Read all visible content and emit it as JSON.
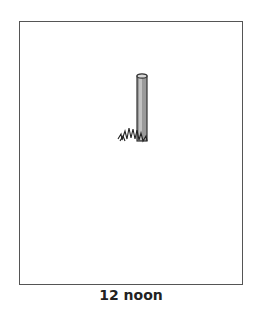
{
  "diagram": {
    "caption": "12 noon",
    "objects": [
      {
        "name": "stick",
        "description": "vertical stick casting no shadow"
      },
      {
        "name": "grass",
        "description": "tuft of grass at stick base"
      }
    ],
    "colors": {
      "frame": "#555555",
      "stick_fill": "#9a9a9a",
      "stick_outline": "#333333"
    }
  }
}
